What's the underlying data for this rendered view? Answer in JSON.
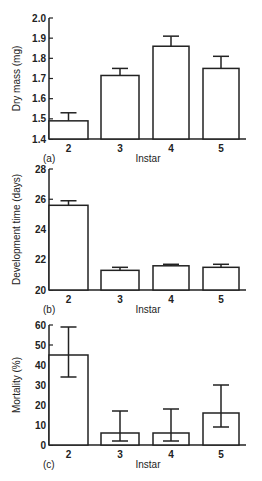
{
  "chart_data": [
    {
      "type": "bar",
      "panel": "(a)",
      "title": "",
      "xlabel": "Instar",
      "ylabel": "Dry mass (mg)",
      "categories": [
        "2",
        "3",
        "4",
        "5"
      ],
      "values": [
        1.49,
        1.715,
        1.86,
        1.75
      ],
      "error_upper": [
        1.53,
        1.75,
        1.91,
        1.81
      ],
      "ylim": [
        1.4,
        2.0
      ],
      "yticks": [
        "1.4",
        "1.5",
        "1.6",
        "1.7",
        "1.8",
        "1.9",
        "2.0"
      ],
      "grid": false
    },
    {
      "type": "bar",
      "panel": "(b)",
      "title": "",
      "xlabel": "Instar",
      "ylabel": "Development time (days)",
      "categories": [
        "2",
        "3",
        "4",
        "5"
      ],
      "values": [
        25.6,
        21.3,
        21.6,
        21.5
      ],
      "error_upper": [
        25.9,
        21.5,
        21.7,
        21.7
      ],
      "ylim": [
        20,
        28
      ],
      "yticks": [
        "20",
        "22",
        "24",
        "26",
        "28"
      ],
      "grid": false
    },
    {
      "type": "bar",
      "panel": "(c)",
      "title": "",
      "xlabel": "Instar",
      "ylabel": "Mortality (%)",
      "categories": [
        "2",
        "3",
        "4",
        "5"
      ],
      "values": [
        45,
        6,
        6,
        16
      ],
      "error_upper": [
        59,
        17,
        18,
        30
      ],
      "error_lower": [
        34,
        2,
        2,
        9
      ],
      "ylim": [
        0,
        60
      ],
      "yticks": [
        "0",
        "10",
        "20",
        "30",
        "40",
        "50",
        "60"
      ],
      "grid": false
    }
  ]
}
